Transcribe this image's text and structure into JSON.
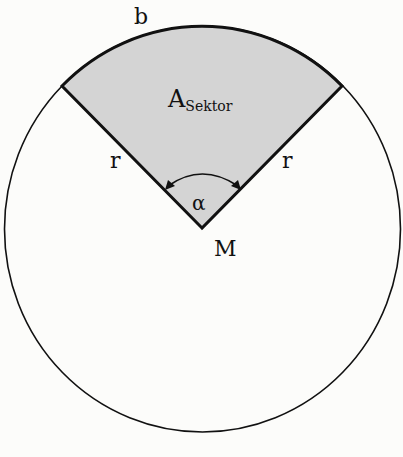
{
  "diagram": {
    "type": "circle-sector",
    "labels": {
      "arc": "b",
      "area_main": "A",
      "area_sub": "Sektor",
      "radius_left": "r",
      "radius_right": "r",
      "angle": "α",
      "center": "M"
    },
    "colors": {
      "sector_fill": "#d4d4d4",
      "stroke": "#111111",
      "background": "#fcfcfa"
    }
  }
}
